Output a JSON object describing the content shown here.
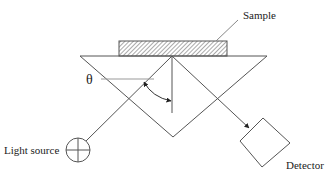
{
  "diagram": {
    "labels": {
      "sample": "Sample",
      "theta": "θ",
      "light_source": "Light source",
      "detector": "Detector"
    },
    "colors": {
      "stroke": "#555555",
      "text": "#222222",
      "background": "#ffffff"
    }
  }
}
